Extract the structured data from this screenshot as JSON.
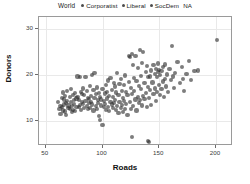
{
  "legend": {
    "title": "World",
    "items": [
      {
        "label": "Corporatist",
        "color": "#4d4d4d"
      },
      {
        "label": "Liberal",
        "color": "#4d4d4d"
      },
      {
        "label": "SocDem",
        "color": "#4d4d4d"
      },
      {
        "label": "NA",
        "color": "#4d4d4d"
      }
    ]
  },
  "chart_data": {
    "type": "scatter",
    "title": "",
    "xlabel": "Roads",
    "ylabel": "Donors",
    "xlim": [
      44,
      215
    ],
    "ylim": [
      4.5,
      32.5
    ],
    "xticks": [
      50,
      100,
      150,
      200
    ],
    "yticks": [
      10,
      20,
      30
    ],
    "grid": true,
    "legend_position": "top",
    "point_color": "#2d2d2d",
    "point_opacity": 0.62,
    "series": [
      {
        "name": "World",
        "points": [
          [
            61,
            14.1
          ],
          [
            62,
            12.5
          ],
          [
            63,
            13.2
          ],
          [
            63,
            11.4
          ],
          [
            64,
            15.0
          ],
          [
            64,
            13.0
          ],
          [
            65,
            16.1
          ],
          [
            65,
            12.2
          ],
          [
            66,
            14.6
          ],
          [
            66,
            13.5
          ],
          [
            67,
            12.0
          ],
          [
            67,
            15.4
          ],
          [
            68,
            13.8
          ],
          [
            68,
            11.2
          ],
          [
            69,
            16.5
          ],
          [
            69,
            14.2
          ],
          [
            70,
            12.8
          ],
          [
            70,
            13.3
          ],
          [
            71,
            15.1
          ],
          [
            71,
            12.6
          ],
          [
            72,
            14.0
          ],
          [
            72,
            16.8
          ],
          [
            73,
            13.1
          ],
          [
            73,
            11.8
          ],
          [
            74,
            15.6
          ],
          [
            74,
            12.4
          ],
          [
            75,
            14.4
          ],
          [
            75,
            13.6
          ],
          [
            76,
            12.1
          ],
          [
            76,
            16.0
          ],
          [
            77,
            14.8
          ],
          [
            77,
            13.0
          ],
          [
            78,
            19.6
          ],
          [
            78,
            15.2
          ],
          [
            79,
            12.9
          ],
          [
            79,
            14.5
          ],
          [
            80,
            19.4
          ],
          [
            80,
            13.4
          ],
          [
            81,
            16.2
          ],
          [
            81,
            12.3
          ],
          [
            82,
            15.8
          ],
          [
            82,
            14.1
          ],
          [
            83,
            13.7
          ],
          [
            83,
            17.0
          ],
          [
            84,
            12.7
          ],
          [
            84,
            15.5
          ],
          [
            85,
            14.3
          ],
          [
            85,
            19.5
          ],
          [
            86,
            13.2
          ],
          [
            86,
            16.4
          ],
          [
            87,
            12.5
          ],
          [
            87,
            15.0
          ],
          [
            88,
            14.7
          ],
          [
            88,
            13.9
          ],
          [
            89,
            17.6
          ],
          [
            89,
            12.8
          ],
          [
            90,
            15.3
          ],
          [
            90,
            14.0
          ],
          [
            91,
            19.9
          ],
          [
            91,
            13.5
          ],
          [
            92,
            16.6
          ],
          [
            92,
            12.2
          ],
          [
            93,
            20.3
          ],
          [
            93,
            14.9
          ],
          [
            94,
            13.1
          ],
          [
            94,
            15.7
          ],
          [
            95,
            12.6
          ],
          [
            95,
            17.2
          ],
          [
            96,
            14.4
          ],
          [
            96,
            13.8
          ],
          [
            97,
            16.0
          ],
          [
            97,
            11.0
          ],
          [
            98,
            15.1
          ],
          [
            98,
            10.2
          ],
          [
            99,
            14.6
          ],
          [
            99,
            13.3
          ],
          [
            100,
            9.0
          ],
          [
            100,
            16.9
          ],
          [
            101,
            14.2
          ],
          [
            101,
            12.9
          ],
          [
            102,
            15.9
          ],
          [
            102,
            13.6
          ],
          [
            103,
            17.8
          ],
          [
            103,
            12.4
          ],
          [
            104,
            14.8
          ],
          [
            104,
            16.3
          ],
          [
            105,
            13.0
          ],
          [
            105,
            18.7
          ],
          [
            106,
            15.4
          ],
          [
            106,
            12.1
          ],
          [
            107,
            19.2
          ],
          [
            107,
            14.0
          ],
          [
            108,
            13.5
          ],
          [
            108,
            16.7
          ],
          [
            109,
            12.7
          ],
          [
            109,
            15.2
          ],
          [
            110,
            18.2
          ],
          [
            110,
            13.9
          ],
          [
            111,
            14.5
          ],
          [
            111,
            17.4
          ],
          [
            112,
            12.3
          ],
          [
            112,
            16.1
          ],
          [
            113,
            20.4
          ],
          [
            113,
            13.2
          ],
          [
            114,
            15.6
          ],
          [
            114,
            11.6
          ],
          [
            115,
            18.0
          ],
          [
            115,
            14.1
          ],
          [
            116,
            12.8
          ],
          [
            116,
            19.0
          ],
          [
            117,
            16.5
          ],
          [
            117,
            13.4
          ],
          [
            118,
            15.0
          ],
          [
            118,
            11.9
          ],
          [
            119,
            17.7
          ],
          [
            119,
            14.3
          ],
          [
            120,
            12.5
          ],
          [
            120,
            19.8
          ],
          [
            121,
            16.2
          ],
          [
            121,
            13.7
          ],
          [
            122,
            15.5
          ],
          [
            122,
            11.3
          ],
          [
            123,
            24.1
          ],
          [
            123,
            18.4
          ],
          [
            124,
            14.0
          ],
          [
            124,
            23.8
          ],
          [
            125,
            12.6
          ],
          [
            125,
            17.1
          ],
          [
            126,
            24.4
          ],
          [
            126,
            15.8
          ],
          [
            126,
            6.4
          ],
          [
            127,
            13.1
          ],
          [
            127,
            22.0
          ],
          [
            128,
            16.4
          ],
          [
            128,
            19.3
          ],
          [
            129,
            14.6
          ],
          [
            129,
            24.0
          ],
          [
            130,
            12.2
          ],
          [
            130,
            18.6
          ],
          [
            131,
            15.1
          ],
          [
            131,
            21.5
          ],
          [
            132,
            13.8
          ],
          [
            132,
            17.5
          ],
          [
            133,
            25.3
          ],
          [
            133,
            14.4
          ],
          [
            134,
            16.9
          ],
          [
            134,
            19.7
          ],
          [
            135,
            13.3
          ],
          [
            135,
            22.6
          ],
          [
            136,
            15.3
          ],
          [
            136,
            24.9
          ],
          [
            137,
            18.1
          ],
          [
            137,
            14.7
          ],
          [
            138,
            20.6
          ],
          [
            138,
            16.0
          ],
          [
            139,
            13.0
          ],
          [
            139,
            21.9
          ],
          [
            140,
            5.6
          ],
          [
            140,
            17.3
          ],
          [
            140,
            19.5
          ],
          [
            141,
            5.4
          ],
          [
            141,
            14.9
          ],
          [
            142,
            19.6
          ],
          [
            142,
            16.6
          ],
          [
            143,
            13.4
          ],
          [
            143,
            20.9
          ],
          [
            144,
            18.3
          ],
          [
            145,
            15.7
          ],
          [
            145,
            22.1
          ],
          [
            146,
            20.1
          ],
          [
            146,
            17.0
          ],
          [
            147,
            21.3
          ],
          [
            147,
            14.2
          ],
          [
            148,
            19.4
          ],
          [
            148,
            16.3
          ],
          [
            149,
            20.5
          ],
          [
            149,
            22.4
          ],
          [
            150,
            17.8
          ],
          [
            150,
            21.0
          ],
          [
            151,
            19.9
          ],
          [
            151,
            15.5
          ],
          [
            152,
            20.8
          ],
          [
            152,
            16.8
          ],
          [
            153,
            21.6
          ],
          [
            153,
            18.5
          ],
          [
            154,
            15.2
          ],
          [
            155,
            19.1
          ],
          [
            155,
            22.2
          ],
          [
            156,
            17.4
          ],
          [
            157,
            20.0
          ],
          [
            158,
            16.2
          ],
          [
            159,
            21.2
          ],
          [
            160,
            18.8
          ],
          [
            161,
            26.2
          ],
          [
            162,
            19.6
          ],
          [
            163,
            17.1
          ],
          [
            164,
            20.4
          ],
          [
            166,
            22.8
          ],
          [
            168,
            18.2
          ],
          [
            170,
            21.7
          ],
          [
            171,
            19.0
          ],
          [
            172,
            16.5
          ],
          [
            174,
            20.2
          ],
          [
            176,
            22.9
          ],
          [
            178,
            18.9
          ],
          [
            181,
            20.7
          ],
          [
            184,
            20.9
          ],
          [
            201,
            27.5
          ]
        ]
      }
    ]
  },
  "axis": {
    "x_title": "Roads",
    "y_title": "Donors",
    "x_tick_labels": [
      "50",
      "100",
      "150",
      "200"
    ],
    "y_tick_labels": [
      "10",
      "20",
      "30"
    ]
  }
}
